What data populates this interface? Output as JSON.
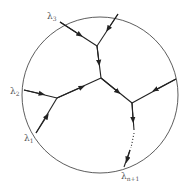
{
  "diagram": {
    "labels": {
      "lambda3": "λ",
      "lambda3_sub": "3",
      "lambda2": "λ",
      "lambda2_sub": "2",
      "lambda1": "λ",
      "lambda1_sub": "1",
      "lambdan1": "λ",
      "lambdan1_sub": "n+1"
    },
    "colors": {
      "stroke": "#222222",
      "label": "#555555"
    }
  }
}
